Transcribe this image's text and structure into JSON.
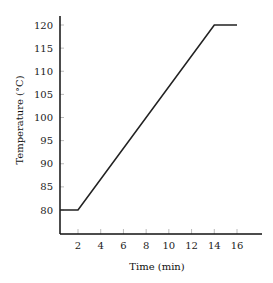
{
  "chart_data": {
    "type": "line",
    "title": "",
    "xlabel": "Time (min)",
    "ylabel": "Temperature (°C)",
    "xlim": [
      0,
      18
    ],
    "ylim": [
      75,
      122
    ],
    "xticks": [
      2,
      4,
      6,
      8,
      10,
      12,
      14,
      16
    ],
    "yticks": [
      80,
      85,
      90,
      95,
      100,
      105,
      110,
      115,
      120
    ],
    "grid": false,
    "legend": null,
    "series": [
      {
        "name": "Temperature",
        "color": "#222222",
        "x": [
          0,
          2,
          14,
          16
        ],
        "y": [
          80,
          80,
          120,
          120
        ]
      }
    ]
  }
}
